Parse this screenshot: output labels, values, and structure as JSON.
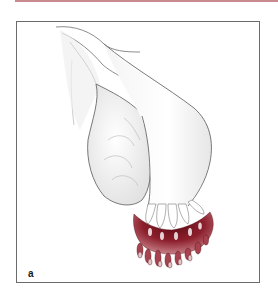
{
  "figure": {
    "panel_label": "a",
    "colors": {
      "top_rule": "#c98a8f",
      "frame_border": "#6b6b6b",
      "outline": "#6e6e6e",
      "shading": "#d9d9d9",
      "fimbriae_dark": "#7a1420",
      "fimbriae_mid": "#a8424e",
      "fimbriae_light": "#e7c4c8"
    }
  }
}
